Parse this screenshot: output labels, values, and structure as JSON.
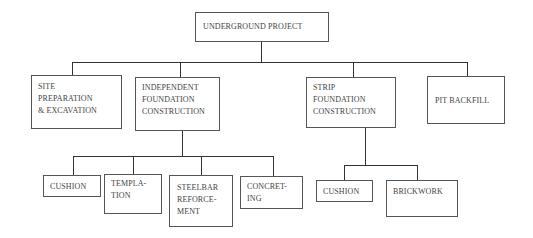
{
  "diagram": {
    "type": "org-chart",
    "root": {
      "label": "UNDERGROUND PROJECT"
    },
    "level1": [
      {
        "label": "SITE\nPREPARATION\n& EXCAVATION"
      },
      {
        "label": "INDEPENDENT\nFOUNDATION\nCONSTRUCTION"
      },
      {
        "label": "STRIP\nFOUNDATION\nCONSTRUCTION"
      },
      {
        "label": "PIT BACKFILL"
      }
    ],
    "independent_children": [
      {
        "label": "CUSHION"
      },
      {
        "label": "TEMPLA-\nTION"
      },
      {
        "label": "STEELBAR\nREFORCE-\nMENT"
      },
      {
        "label": "CONCRET-\nING"
      }
    ],
    "strip_children": [
      {
        "label": "CUSHION"
      },
      {
        "label": "BRICKWORK"
      }
    ],
    "colors": {
      "line": "#333333",
      "border": "#555555",
      "text": "#444444"
    }
  }
}
